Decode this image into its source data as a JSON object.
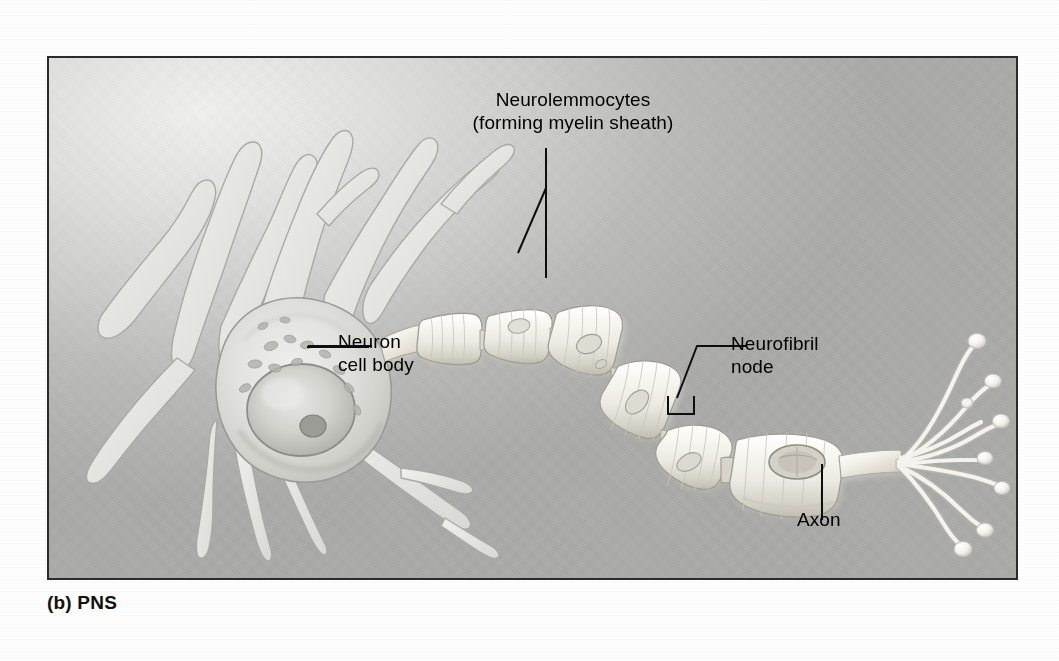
{
  "figure": {
    "caption": "(b) PNS",
    "frame_color": "#2b2b2b",
    "background_light": "#f2f2f0",
    "background_dark": "#a3a3a1"
  },
  "labels": {
    "neurolemmocytes": "Neurolemmocytes\n(forming myelin sheath)",
    "neuron_cell_body": "Neuron\ncell body",
    "neurofibril_node": "Neurofibril\nnode",
    "axon": "Axon"
  },
  "structures": {
    "soma": "neuron-cell-body",
    "dendrites_count": 7,
    "myelin_segments_count": 8,
    "axon_terminal_branches": 8,
    "nucleus": "nucleus",
    "nucleolus": "nucleolus"
  },
  "colors": {
    "ink": "#000000",
    "leader_line": "#111111",
    "cell_outline": "#8f8f8d",
    "myelin_fill": "#f4f2ec",
    "myelin_shadow": "#b9b7b0",
    "terminal_fill": "#f6f5f0"
  }
}
